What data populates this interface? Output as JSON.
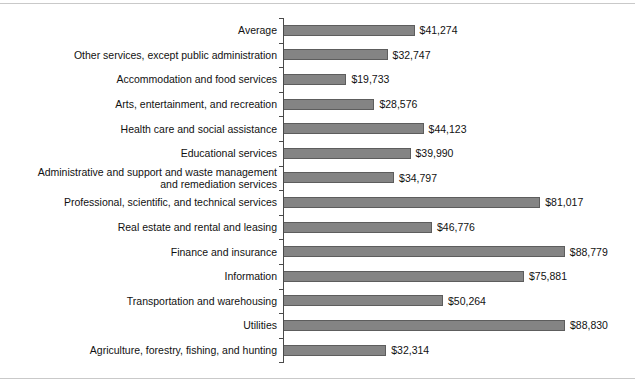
{
  "chart_data": {
    "type": "bar",
    "orientation": "horizontal",
    "title": "",
    "subtitle": "",
    "xlabel": "",
    "ylabel": "",
    "grid": false,
    "legend": false,
    "value_prefix": "$",
    "xlim": [
      0,
      88830
    ],
    "categories": [
      "Average",
      "Other services, except public administration",
      "Accommodation and food services",
      "Arts, entertainment, and recreation",
      "Health care and social assistance",
      "Educational services",
      "Administrative and support and waste management\nand remediation services",
      "Professional, scientific, and technical services",
      "Real estate and rental and leasing",
      "Finance and insurance",
      "Information",
      "Transportation and warehousing",
      "Utilities",
      "Agriculture, forestry, fishing, and hunting"
    ],
    "values": [
      41274,
      32747,
      19733,
      28576,
      44123,
      39990,
      34797,
      81017,
      46776,
      88779,
      75881,
      50264,
      88830,
      32314
    ],
    "value_labels": [
      "$41,274",
      "$32,747",
      "$19,733",
      "$28,576",
      "$44,123",
      "$39,990",
      "$34,797",
      "$81,017",
      "$46,776",
      "$88,779",
      "$75,881",
      "$50,264",
      "$88,830",
      "$32,314"
    ],
    "colors": {
      "bar_fill": "#848484",
      "bar_edge": "#5d5d5d",
      "axis": "#4a4a4a",
      "text": "#111111",
      "frame_rule": "#c9c9c9",
      "background": "#ffffff"
    }
  }
}
